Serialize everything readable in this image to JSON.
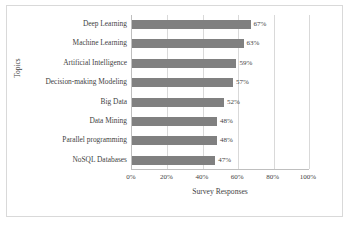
{
  "chart_data": {
    "type": "bar",
    "orientation": "horizontal",
    "title": "",
    "xlabel": "Survey Responses",
    "ylabel": "Topics",
    "categories": [
      "Deep Learning",
      "Machine Learning",
      "Artificial Intelligence",
      "Decision-making Modeling",
      "Big Data",
      "Data Mining",
      "Parallel programming",
      "NoSQL Databases"
    ],
    "values": [
      67,
      63,
      59,
      57,
      52,
      48,
      48,
      47
    ],
    "data_labels": [
      "67%",
      "63%",
      "59%",
      "57%",
      "52%",
      "48%",
      "48%",
      "47%"
    ],
    "xlim": [
      0,
      100
    ],
    "xticks": [
      0,
      20,
      40,
      60,
      80,
      100
    ],
    "xtick_labels": [
      "0%",
      "20%",
      "40%",
      "60%",
      "80%",
      "100%"
    ],
    "grid": "vertical",
    "legend": "none",
    "bar_color": "#808080",
    "gridline_color": "#d9d9d9",
    "axis_color": "#bfbfbf",
    "text_color": "#3f3f3f",
    "frame_border_color": "#d9d9d9",
    "background": "#ffffff"
  }
}
